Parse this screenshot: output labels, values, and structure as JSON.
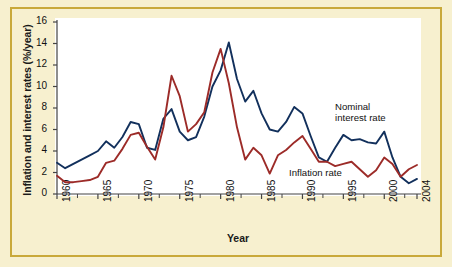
{
  "chart_data": {
    "type": "line",
    "title": "",
    "xlabel": "Year",
    "ylabel": "Inflation and interest rates (%/year)",
    "xlim": [
      1960,
      2004
    ],
    "ylim": [
      0,
      16
    ],
    "grid": false,
    "legend_position": "inline-annotation",
    "y_ticks": [
      0,
      2,
      4,
      6,
      8,
      10,
      12,
      14,
      16
    ],
    "x_ticks": [
      1960,
      1965,
      1970,
      1975,
      1980,
      1985,
      1990,
      1995,
      2000,
      2004
    ],
    "x": [
      1960,
      1961,
      1962,
      1963,
      1964,
      1965,
      1966,
      1967,
      1968,
      1969,
      1970,
      1971,
      1972,
      1973,
      1974,
      1975,
      1976,
      1977,
      1978,
      1979,
      1980,
      1981,
      1982,
      1983,
      1984,
      1985,
      1986,
      1987,
      1988,
      1989,
      1990,
      1991,
      1992,
      1993,
      1994,
      1995,
      1996,
      1997,
      1998,
      1999,
      2000,
      2001,
      2002,
      2003,
      2004
    ],
    "series": [
      {
        "name": "Nominal interest rate",
        "color": "#12305c",
        "values": [
          2.9,
          2.4,
          2.8,
          3.2,
          3.6,
          4.0,
          4.9,
          4.3,
          5.3,
          6.7,
          6.5,
          4.3,
          4.1,
          7.0,
          7.9,
          5.8,
          5.0,
          5.3,
          7.2,
          10.0,
          11.5,
          14.1,
          10.7,
          8.6,
          9.6,
          7.5,
          6.0,
          5.8,
          6.7,
          8.1,
          7.5,
          5.4,
          3.4,
          3.0,
          4.3,
          5.5,
          5.0,
          5.1,
          4.8,
          4.7,
          5.8,
          3.4,
          1.6,
          1.0,
          1.4
        ]
      },
      {
        "name": "Inflation rate",
        "color": "#9c2b28",
        "values": [
          1.7,
          1.1,
          1.1,
          1.2,
          1.3,
          1.6,
          2.9,
          3.1,
          4.2,
          5.5,
          5.7,
          4.4,
          3.2,
          6.2,
          11.0,
          9.1,
          5.8,
          6.5,
          7.6,
          11.3,
          13.5,
          10.3,
          6.2,
          3.2,
          4.3,
          3.6,
          1.9,
          3.6,
          4.1,
          4.8,
          5.4,
          4.2,
          3.0,
          3.0,
          2.6,
          2.8,
          3.0,
          2.3,
          1.6,
          2.2,
          3.4,
          2.8,
          1.6,
          2.3,
          2.7
        ]
      }
    ],
    "annotations": [
      {
        "id": "nominal",
        "text": "Nominal\ninterest rate",
        "x": 1995,
        "y": 9.5
      },
      {
        "id": "inflation",
        "text": "Inflation rate",
        "x": 1989,
        "y": 2.6
      }
    ]
  },
  "figure": {
    "background_color": "#f7f0cf",
    "border_color": "#c9a93a",
    "plot_background": "#ffffff",
    "axis_color": "#444444"
  }
}
